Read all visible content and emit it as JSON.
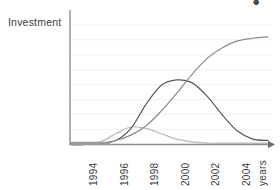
{
  "chart_data": {
    "type": "line",
    "title": "",
    "subtitle": "",
    "xlabel": "years",
    "ylabel": "Investment",
    "grid": true,
    "gridlines": 8,
    "legend": "none",
    "xlim": [
      1993,
      2006
    ],
    "ylim": [
      0,
      100
    ],
    "x_tick_labels": [
      "1994",
      "1996",
      "1998",
      "2000",
      "2002",
      "2004"
    ],
    "x_tick_values": [
      1994,
      1996,
      1998,
      2000,
      2002,
      2004
    ],
    "y_tick_labels": [],
    "axis_arrow": "right",
    "series": [
      {
        "name": "early-wave",
        "shape": "bell",
        "color": "#b9b9b9",
        "peak_year": 1997,
        "peak_value": 13,
        "x": [
          1993,
          1994,
          1995,
          1996,
          1997,
          1998,
          1999,
          2000,
          2001,
          2002,
          2003,
          2004,
          2005,
          2006
        ],
        "values": [
          0,
          0,
          2,
          8,
          13,
          12,
          8,
          4,
          2,
          1,
          1,
          1,
          1,
          1
        ]
      },
      {
        "name": "main-wave",
        "shape": "bell",
        "color": "#595959",
        "peak_year": 2000,
        "peak_value": 48,
        "x": [
          1993,
          1994,
          1995,
          1996,
          1997,
          1998,
          1999,
          2000,
          2001,
          2002,
          2003,
          2004,
          2005,
          2006
        ],
        "values": [
          0,
          0,
          1,
          3,
          12,
          30,
          44,
          48,
          46,
          36,
          22,
          10,
          4,
          3
        ]
      },
      {
        "name": "cumulative-growth",
        "shape": "sigmoid",
        "color": "#8a8a8a",
        "plateau_value": 80,
        "x": [
          1993,
          1994,
          1995,
          1996,
          1997,
          1998,
          1999,
          2000,
          2001,
          2002,
          2003,
          2004,
          2005,
          2006
        ],
        "values": [
          0,
          0,
          1,
          3,
          7,
          14,
          25,
          38,
          52,
          64,
          72,
          77,
          79,
          80
        ]
      }
    ]
  },
  "axes": {
    "y_title": "Investment",
    "x_title": "years"
  },
  "corner": {
    "glyph": "●"
  },
  "colors": {
    "axis": "#8d8d8d",
    "grid": "#f1f1f4",
    "baseline_highlight": "#9a9a9a",
    "text": "#3c3c3c"
  }
}
